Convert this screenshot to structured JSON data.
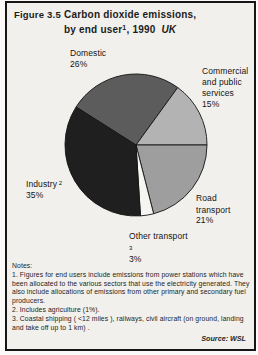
{
  "header": {
    "figure_label": "Figure 3.5",
    "title_line1": "Carbon dioxide emissions,",
    "title_line2_prefix": "by end user",
    "title_note_ref": "1",
    "title_line2_suffix": ", 1990",
    "region": "UK"
  },
  "chart_data": {
    "type": "pie",
    "unit": "percent",
    "start_angle_deg": -57.6,
    "stroke_color": "#141414",
    "legend_position": "labels-around-pie",
    "slices": [
      {
        "id": "domestic",
        "name": "Domestic",
        "pct": 26,
        "color": "#5c5c5c"
      },
      {
        "id": "commercial-public-services",
        "name": "Commercial and public services",
        "pct": 15,
        "color": "#b3b3b3"
      },
      {
        "id": "road-transport",
        "name": "Road transport",
        "pct": 21,
        "color": "#9e9e9e"
      },
      {
        "id": "other-transport",
        "name": "Other transport",
        "pct": 3,
        "sup": "3",
        "color": "#f6f5f2"
      },
      {
        "id": "industry",
        "name": "Industry",
        "pct": 35,
        "sup": "2",
        "color": "#1f1f1f"
      }
    ]
  },
  "notes": {
    "heading": "Notes:",
    "items": [
      "1. Figures for end users include emissions from power stations which have been allocated to the various sectors that use the electricity generated. They also include allocations of emissions from other primary and secondary fuel producers.",
      "2. Includes agriculture (1%).",
      "3. Coastal shipping ( <12 miles ), railways, civil aircraft (on ground, landing and take off up to 1 km) ."
    ],
    "source": "Source: WSL"
  }
}
